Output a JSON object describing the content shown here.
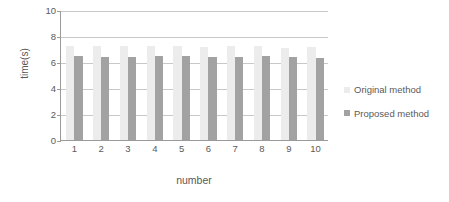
{
  "chart_data": {
    "type": "bar",
    "title": "",
    "xlabel": "number",
    "ylabel": "time(s)",
    "categories": [
      "1",
      "2",
      "3",
      "4",
      "5",
      "6",
      "7",
      "8",
      "9",
      "10"
    ],
    "ylim": [
      0,
      10
    ],
    "yticks": [
      "0",
      "2",
      "4",
      "6",
      "8",
      "10"
    ],
    "grid": true,
    "legend_position": "right",
    "series": [
      {
        "name": "Original method",
        "color": "#ececec",
        "values": [
          7.2,
          7.2,
          7.2,
          7.25,
          7.2,
          7.15,
          7.2,
          7.2,
          7.1,
          7.15
        ]
      },
      {
        "name": "Proposed method",
        "color": "#a2a2a2",
        "values": [
          6.5,
          6.4,
          6.4,
          6.5,
          6.5,
          6.35,
          6.35,
          6.45,
          6.4,
          6.3
        ]
      }
    ]
  },
  "axis": {
    "y_title": "time(s)",
    "x_title": "number"
  },
  "legend": {
    "items": [
      {
        "label": "Original method",
        "color": "#ececec",
        "swatch_icon": "square-swatch-icon"
      },
      {
        "label": "Proposed method",
        "color": "#a2a2a2",
        "swatch_icon": "square-swatch-icon"
      }
    ]
  }
}
